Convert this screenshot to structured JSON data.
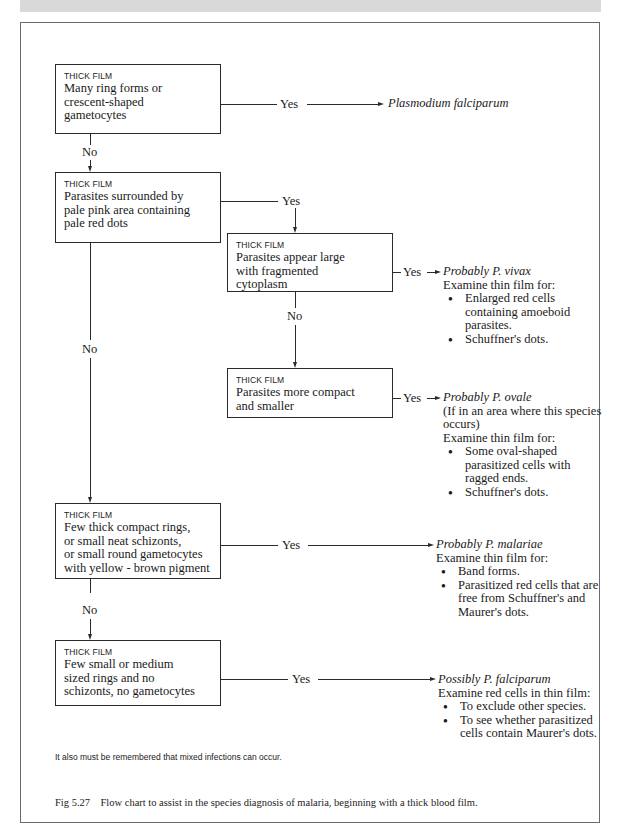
{
  "page": {
    "figure_caption": "Fig 5.27    Flow chart to assist in the species diagnosis of malaria, beginning with a thick blood film.",
    "note": "It also must be remembered that mixed infections can occur."
  },
  "edges": {
    "yes": "Yes",
    "no": "No"
  },
  "nodes": [
    {
      "id": "box1",
      "label": "THICK FILM",
      "text": "Many ring forms or\ncrescent-shaped\ngametocytes"
    },
    {
      "id": "box2",
      "label": "THICK FILM",
      "text": "Parasites surrounded by\npale pink area containing\npale red dots"
    },
    {
      "id": "box3",
      "label": "THICK FILM",
      "text": "Parasites appear large\nwith fragmented\ncytoplasm"
    },
    {
      "id": "box4",
      "label": "THICK FILM",
      "text": "Parasites more compact\nand smaller"
    },
    {
      "id": "box5",
      "label": "THICK FILM",
      "text": "Few thick compact rings,\nor small neat schizonts,\nor small round gametocytes\nwith yellow - brown pigment"
    },
    {
      "id": "box6",
      "label": "THICK FILM",
      "text": "Few small or medium\nsized rings and no\nschizonts, no gametocytes"
    }
  ],
  "results": [
    {
      "id": "falciparum",
      "title": "Plasmodium falciparum",
      "intro": [],
      "bullets": []
    },
    {
      "id": "vivax",
      "title": "Probably P. vivax",
      "intro": [
        "Examine thin film for:"
      ],
      "bullets": [
        "Enlarged red cells containing amoeboid parasites.",
        "Schuffner's dots."
      ]
    },
    {
      "id": "ovale",
      "title": "Probably P. ovale",
      "intro": [
        "(If in an area where this species occurs)",
        "Examine thin film for:"
      ],
      "bullets": [
        "Some oval-shaped parasitized cells with ragged ends.",
        "Schuffner's dots."
      ]
    },
    {
      "id": "malariae",
      "title": "Probably P. malariae",
      "intro": [
        "Examine thin film for:"
      ],
      "bullets": [
        "Band forms.",
        "Parasitized red cells that are free from Schuffner's and Maurer's dots."
      ]
    },
    {
      "id": "possibly-falciparum",
      "title": "Possibly P. falciparum",
      "intro": [
        "Examine red cells in thin film:"
      ],
      "bullets": [
        "To exclude other species.",
        "To see whether parasitized cells contain Maurer's dots."
      ]
    }
  ]
}
